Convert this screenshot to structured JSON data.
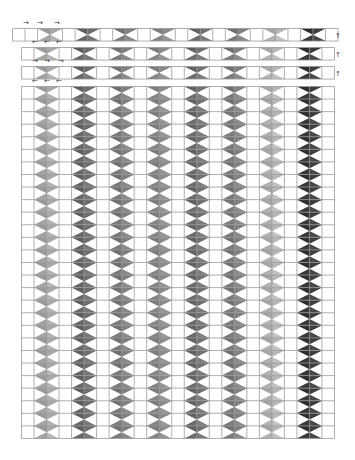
{
  "diagram": {
    "cell_size": 12.52,
    "row_height": 12.57,
    "grid_line_color": "#9a9a9a",
    "diamond_columns": [
      {
        "index": 1,
        "color_a": "#9a9a9a",
        "color_b": "#b4b4b4"
      },
      {
        "index": 2,
        "color_a": "#5e5e5e",
        "color_b": "#777777"
      },
      {
        "index": 3,
        "color_a": "#707070",
        "color_b": "#8a8a8a"
      },
      {
        "index": 4,
        "color_a": "#7c7c7c",
        "color_b": "#959595"
      },
      {
        "index": 5,
        "color_a": "#626262",
        "color_b": "#7c7c7c"
      },
      {
        "index": 6,
        "color_a": "#707070",
        "color_b": "#8a8a8a"
      },
      {
        "index": 7,
        "color_a": "#a6a6a6",
        "color_b": "#c2c2c2"
      },
      {
        "index": 8,
        "color_a": "#2e2e2e",
        "color_b": "#474747"
      }
    ],
    "strips": [
      {
        "name": "strip-1",
        "x": 12,
        "y": 28,
        "cells": 26,
        "offset_cells": 1,
        "arrows": {
          "direction": "right",
          "glyph": "→",
          "y": 20,
          "xs": [
            23,
            37,
            54
          ]
        }
      },
      {
        "name": "strip-2",
        "x": 21,
        "y": 47,
        "cells": 25,
        "offset_cells": 0,
        "arrows": {
          "direction": "left",
          "glyph": "←",
          "y": 39,
          "xs": [
            32,
            44,
            56
          ]
        }
      },
      {
        "name": "strip-3",
        "x": 21,
        "y": 66,
        "cells": 25,
        "offset_cells": 0,
        "arrows": {
          "direction": "right",
          "glyph": "→",
          "y": 58,
          "xs": [
            32,
            44,
            58
          ]
        }
      }
    ],
    "main_grid": {
      "x": 21,
      "y": 86,
      "cols": 25,
      "rows": 28,
      "arrows": {
        "direction": "left",
        "glyph": "←",
        "y": 78,
        "xs": [
          32,
          44,
          56
        ]
      }
    },
    "side_arrows": {
      "direction": "up",
      "glyph": "↑",
      "x": 335,
      "ys": [
        33,
        52,
        71
      ]
    }
  }
}
